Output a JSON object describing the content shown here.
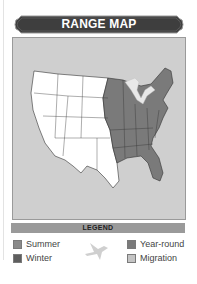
{
  "header": {
    "title": "RANGE MAP"
  },
  "map": {
    "region": "United States",
    "colors": {
      "background": "#cfcfcf",
      "unoccupied": "#ffffff",
      "year_round": "#7a7a7a",
      "lakes": "#e8e8e8"
    }
  },
  "legend": {
    "title": "LEGEND",
    "items": [
      {
        "label": "Summer",
        "color": "#8a8a8a"
      },
      {
        "label": "Winter",
        "color": "#5e5e5e"
      },
      {
        "label": "Year-round",
        "color": "#7a7a7a"
      },
      {
        "label": "Migration",
        "color": "#c4c4c4"
      }
    ],
    "icon": "bird-silhouette-icon"
  }
}
